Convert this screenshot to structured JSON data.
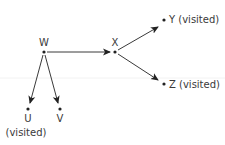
{
  "diagram": {
    "type": "directed-graph",
    "nodes": [
      {
        "id": "W",
        "label": "W",
        "status": "",
        "x": 44,
        "y": 52
      },
      {
        "id": "X",
        "label": "X",
        "status": "",
        "x": 115,
        "y": 52
      },
      {
        "id": "Y",
        "label": "Y (visited)",
        "status": "visited",
        "x": 164,
        "y": 20
      },
      {
        "id": "Z",
        "label": "Z (visited)",
        "status": "visited",
        "x": 164,
        "y": 84
      },
      {
        "id": "U",
        "label": "U",
        "status": "(visited)",
        "x": 28,
        "y": 109
      },
      {
        "id": "V",
        "label": "V",
        "status": "",
        "x": 60,
        "y": 109
      }
    ],
    "edges": [
      {
        "from": "W",
        "to": "X"
      },
      {
        "from": "X",
        "to": "Y"
      },
      {
        "from": "X",
        "to": "Z"
      },
      {
        "from": "W",
        "to": "U"
      },
      {
        "from": "W",
        "to": "V"
      }
    ],
    "colors": {
      "line": "#3a3a3a",
      "text": "#3a3a3a",
      "background": "#ffffff"
    }
  }
}
